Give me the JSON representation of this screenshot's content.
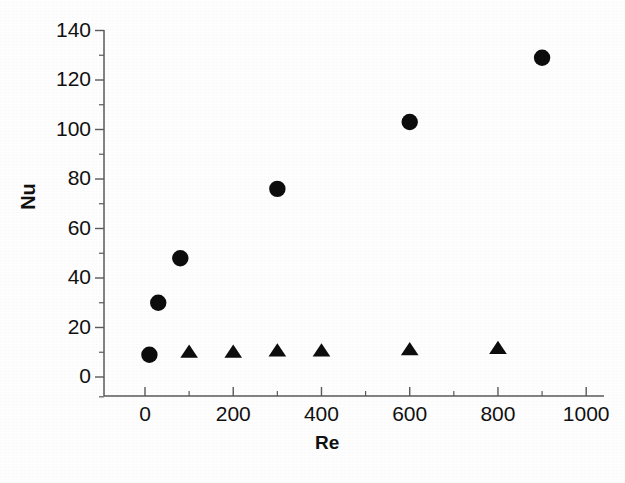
{
  "chart_data": {
    "type": "scatter",
    "title": "",
    "xlabel": "Re",
    "ylabel": "Nu",
    "xlim": [
      -60,
      1040
    ],
    "ylim": [
      -8,
      148
    ],
    "grid": false,
    "legend": "none",
    "xticks": [
      0,
      200,
      400,
      600,
      800,
      1000
    ],
    "xtick_labels": [
      "0",
      "200",
      "400",
      "600",
      "800",
      "1000"
    ],
    "x_minor_ticks": [
      100,
      300,
      500,
      700,
      900
    ],
    "yticks": [
      0,
      20,
      40,
      60,
      80,
      100,
      120,
      140
    ],
    "ytick_labels": [
      "0",
      "20",
      "40",
      "60",
      "80",
      "100",
      "120",
      "140"
    ],
    "y_minor_ticks": [
      10,
      30,
      50,
      70,
      90,
      110,
      130
    ],
    "marker_color": "#0d0d0d",
    "axis_color": "#5a5a5a",
    "series": [
      {
        "name": "Series circle",
        "marker": "circle",
        "x": [
          10,
          30,
          80,
          300,
          600,
          900
        ],
        "y": [
          9,
          30,
          48,
          76,
          103,
          129
        ]
      },
      {
        "name": "Series triangle",
        "marker": "triangle",
        "x": [
          100,
          200,
          300,
          400,
          600,
          800
        ],
        "y": [
          10,
          10,
          10.5,
          10.5,
          11,
          11.5
        ]
      }
    ]
  }
}
